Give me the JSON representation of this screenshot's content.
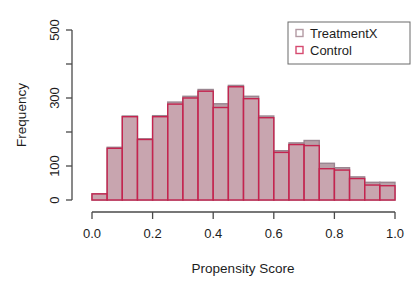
{
  "chart_data": {
    "type": "bar",
    "subtype": "histogram-overlay",
    "title": "",
    "xlabel": "Propensity Score",
    "ylabel": "Frequency",
    "xlim": [
      0.0,
      1.0
    ],
    "ylim": [
      0,
      500
    ],
    "xticks": [
      0.0,
      0.2,
      0.4,
      0.6,
      0.8,
      1.0
    ],
    "xtick_labels": [
      "0.0",
      "0.2",
      "0.4",
      "0.6",
      "0.8",
      "1.0"
    ],
    "yticks": [
      0,
      100,
      200,
      300,
      400,
      500
    ],
    "ytick_labels": [
      "0",
      "",
      "100",
      "",
      "300",
      "",
      "500"
    ],
    "ytick_labeled": [
      0,
      100,
      300,
      500
    ],
    "ytick_unlabeled": [
      200,
      400
    ],
    "grid": false,
    "bin_width": 0.05,
    "bin_edges": [
      0.0,
      0.05,
      0.1,
      0.15,
      0.2,
      0.25,
      0.3,
      0.35,
      0.4,
      0.45,
      0.5,
      0.55,
      0.6,
      0.65,
      0.7,
      0.75,
      0.8,
      0.85,
      0.9,
      0.95,
      1.0
    ],
    "bin_centers": [
      0.025,
      0.075,
      0.125,
      0.175,
      0.225,
      0.275,
      0.325,
      0.375,
      0.425,
      0.475,
      0.525,
      0.575,
      0.625,
      0.675,
      0.725,
      0.775,
      0.825,
      0.875,
      0.925,
      0.975
    ],
    "series": [
      {
        "name": "TreatmentX",
        "fill": "#b8a0a8",
        "stroke": "#9a8590",
        "values": [
          18,
          155,
          247,
          180,
          248,
          288,
          305,
          325,
          283,
          337,
          305,
          247,
          145,
          168,
          175,
          108,
          95,
          68,
          52,
          52
        ]
      },
      {
        "name": "Control",
        "fill": "#d6a9b5",
        "stroke": "#c4244f",
        "values": [
          18,
          152,
          245,
          178,
          245,
          282,
          300,
          320,
          272,
          333,
          298,
          242,
          140,
          163,
          160,
          92,
          88,
          63,
          44,
          42
        ]
      }
    ],
    "legend": {
      "position": "top-right",
      "entries": [
        {
          "label": "TreatmentX",
          "swatch_fill": "#ffffff",
          "swatch_stroke": "#b39aa3"
        },
        {
          "label": "Control",
          "swatch_fill": "#ffffff",
          "swatch_stroke": "#d64a70"
        }
      ]
    },
    "colors": {
      "axis": "#4a4a4a",
      "text": "#1d1d1d",
      "background": "#ffffff",
      "treatment_fill": "#b8a0a8",
      "control_stroke": "#c4244f",
      "control_fill": "#d6a9b5"
    }
  },
  "axes": {
    "y_title": "Frequency",
    "x_title": "Propensity Score"
  }
}
